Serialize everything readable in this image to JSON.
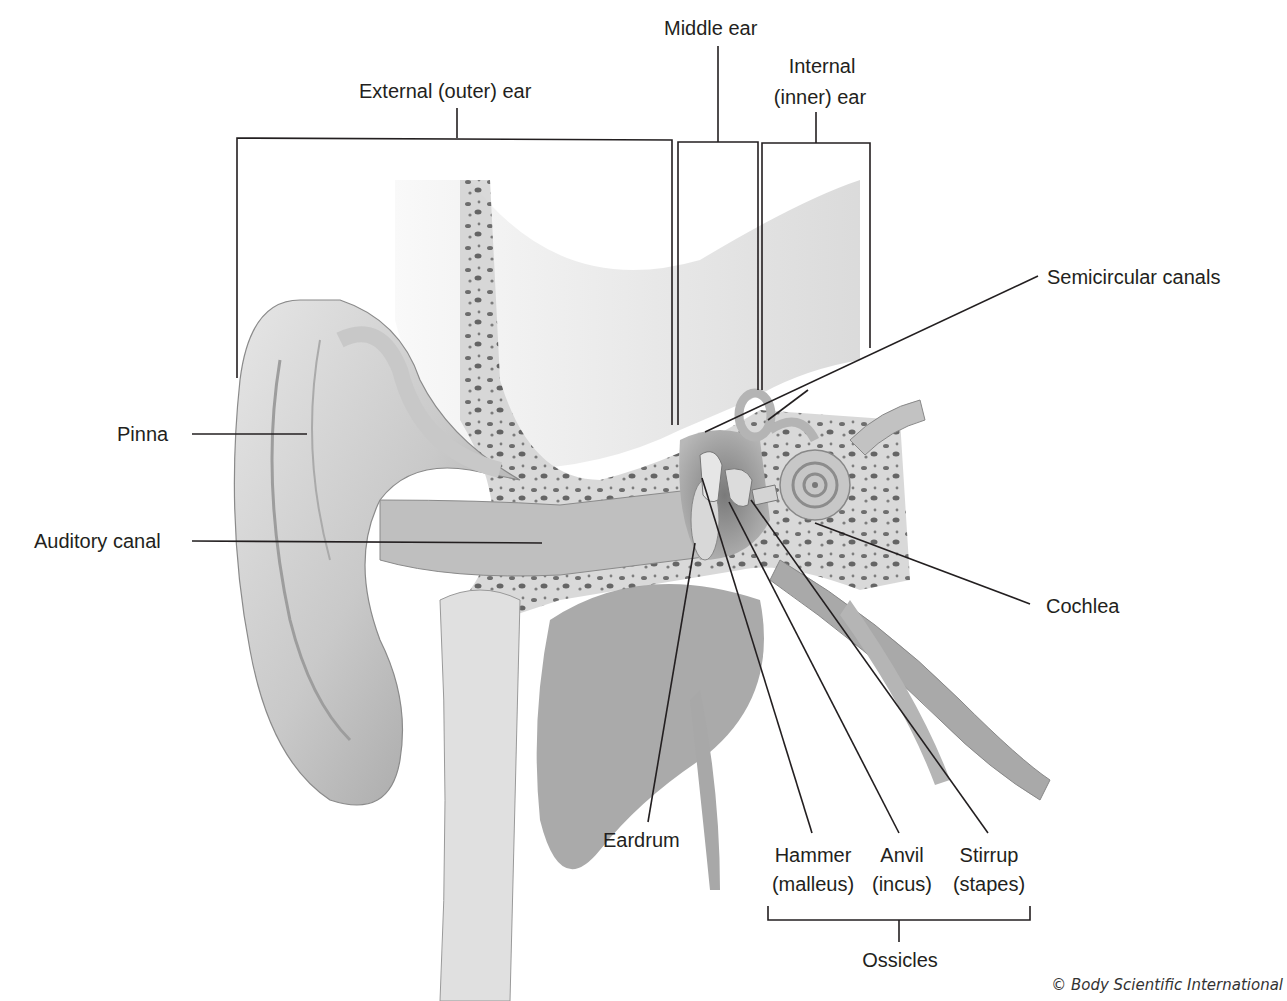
{
  "diagram": {
    "regions": {
      "external": "External (outer) ear",
      "middle": "Middle ear",
      "internal_line1": "Internal",
      "internal_line2": "(inner) ear"
    },
    "labels": {
      "pinna": "Pinna",
      "auditory_canal": "Auditory canal",
      "semicircular_canals": "Semicircular canals",
      "cochlea": "Cochlea",
      "eardrum": "Eardrum",
      "hammer": "Hammer",
      "hammer_latin": "(malleus)",
      "anvil": "Anvil",
      "anvil_latin": "(incus)",
      "stirrup": "Stirrup",
      "stirrup_latin": "(stapes)",
      "ossicles": "Ossicles"
    },
    "credit": "© Body Scientific International"
  }
}
